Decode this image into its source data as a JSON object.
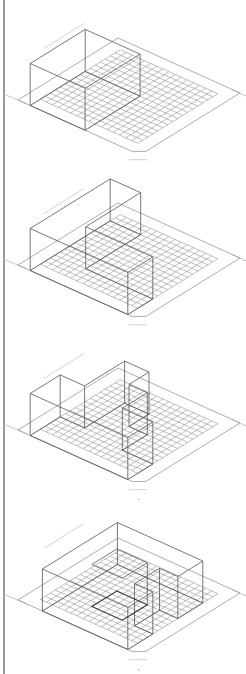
{
  "colors": {
    "background": "#ffffff",
    "line": "#555555",
    "grid": "#8c8c8c",
    "rule": "#9a9a9a"
  },
  "projection": {
    "origin_left_corner": [
      18,
      100
    ],
    "u_vector": [
      6.1,
      2.75
    ],
    "v_vector": [
      5.0,
      -3.1
    ],
    "h_unit": 3.0,
    "grid_cells": 16,
    "base_margin": 2
  },
  "panels": [
    {
      "id": "step-1",
      "top": 0,
      "description": "single bar volume along back edge",
      "volumes": [
        {
          "u": [
            0,
            9
          ],
          "v": [
            0,
            9
          ],
          "h": 0,
          "skip": true
        }
      ],
      "prisms": [
        [
          [
            0,
            6
          ],
          [
            9,
            6
          ],
          [
            9,
            18
          ],
          [
            0,
            18
          ]
        ]
      ],
      "height": 14
    },
    {
      "id": "step-2",
      "top": 165,
      "description": "U-shaped volume",
      "prisms": [
        [
          [
            0,
            2
          ],
          [
            13,
            2
          ],
          [
            13,
            14
          ],
          [
            16,
            14
          ],
          [
            16,
            18
          ],
          [
            0,
            18
          ],
          [
            0,
            14
          ],
          [
            0,
            2
          ]
        ]
      ],
      "outline": [
        [
          0,
          2
        ],
        [
          5,
          2
        ],
        [
          5,
          13
        ],
        [
          16,
          13
        ],
        [
          16,
          18
        ],
        [
          0,
          18
        ]
      ],
      "height": 14
    },
    {
      "id": "step-3",
      "top": 330,
      "description": "stepped volume with notched corner",
      "outline": [
        [
          4,
          4
        ],
        [
          8,
          4
        ],
        [
          8,
          8
        ],
        [
          11,
          8
        ],
        [
          11,
          13
        ],
        [
          16,
          13
        ],
        [
          16,
          18
        ],
        [
          0,
          18
        ],
        [
          0,
          12
        ],
        [
          4,
          12
        ]
      ],
      "height": 14
    },
    {
      "id": "step-4",
      "top": 500,
      "description": "ring volume with courtyard",
      "outline": [
        [
          2,
          3
        ],
        [
          16,
          3
        ],
        [
          16,
          8
        ],
        [
          13,
          8
        ],
        [
          13,
          13
        ],
        [
          16,
          13
        ],
        [
          16,
          18
        ],
        [
          2,
          18
        ]
      ],
      "courtyard": [
        [
          6,
          8
        ],
        [
          11,
          8
        ],
        [
          11,
          13
        ],
        [
          6,
          13
        ]
      ],
      "height": 14
    }
  ]
}
